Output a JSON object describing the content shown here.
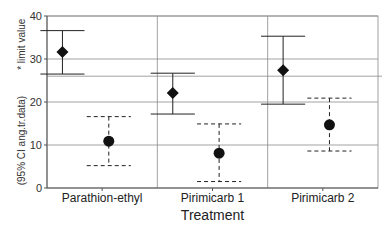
{
  "chart_data": {
    "type": "scatter",
    "title": "",
    "xlabel": "Treatment",
    "ylabel_part1": "(95% CI ang.tr.data)",
    "ylabel_part2": "* limit value",
    "ylim": [
      0,
      40
    ],
    "yticks": [
      0,
      10,
      20,
      30,
      40
    ],
    "grid": true,
    "reference_line": 26,
    "categories": [
      "Parathion-ethyl",
      "Pirimicarb 1",
      "Pirimicarb 2"
    ],
    "series": [
      {
        "name": "limit value (diamond, solid CI)",
        "marker": "diamond",
        "line": "solid",
        "values": [
          31.6,
          22.1,
          27.4
        ],
        "ci_lower": [
          26.5,
          17.2,
          19.5
        ],
        "ci_upper": [
          36.6,
          26.7,
          35.3
        ]
      },
      {
        "name": "treatment (circle, dashed CI)",
        "marker": "circle",
        "line": "dashed",
        "values": [
          10.9,
          8.1,
          14.7
        ],
        "ci_lower": [
          5.2,
          1.5,
          8.6
        ],
        "ci_upper": [
          16.6,
          14.9,
          20.9
        ]
      }
    ]
  }
}
